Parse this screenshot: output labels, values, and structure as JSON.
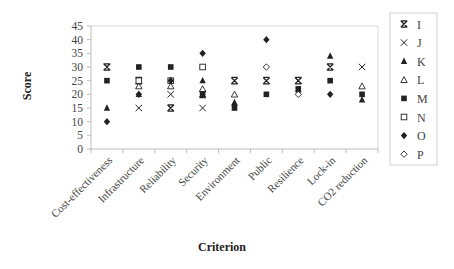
{
  "chart_data": {
    "type": "scatter",
    "title": "",
    "xlabel": "Criterion",
    "ylabel": "Score",
    "ylim": [
      0,
      45
    ],
    "yticks": [
      0,
      5,
      10,
      15,
      20,
      25,
      30,
      35,
      40,
      45
    ],
    "grid": false,
    "legend_position": "right",
    "categories": [
      "Cost-effectiveness",
      "Infrastructure",
      "Reliability",
      "Security",
      "Environment",
      "Public",
      "Resilience",
      "Lock-in",
      "CO2 reduction"
    ],
    "series": [
      {
        "name": "I",
        "marker": "asterisk-x",
        "values": [
          30,
          25,
          15,
          20,
          25,
          25,
          25,
          30,
          null
        ]
      },
      {
        "name": "J",
        "marker": "x",
        "values": [
          30,
          15,
          20,
          15,
          null,
          null,
          25,
          null,
          30
        ]
      },
      {
        "name": "K",
        "marker": "triangle-filled",
        "values": [
          15,
          20,
          25,
          25,
          17,
          null,
          null,
          34,
          18
        ]
      },
      {
        "name": "L",
        "marker": "triangle-open",
        "values": [
          null,
          23,
          23,
          22,
          20,
          null,
          null,
          null,
          23
        ]
      },
      {
        "name": "M",
        "marker": "square-filled",
        "values": [
          25,
          30,
          30,
          20,
          15,
          20,
          22,
          25,
          20
        ]
      },
      {
        "name": "N",
        "marker": "square-open",
        "values": [
          null,
          25,
          25,
          30,
          null,
          null,
          null,
          null,
          null
        ]
      },
      {
        "name": "O",
        "marker": "diamond-filled",
        "values": [
          10,
          20,
          25,
          35,
          16,
          40,
          21,
          20,
          null
        ]
      },
      {
        "name": "P",
        "marker": "diamond-open",
        "values": [
          null,
          null,
          null,
          null,
          null,
          30,
          20,
          null,
          null
        ]
      }
    ]
  }
}
